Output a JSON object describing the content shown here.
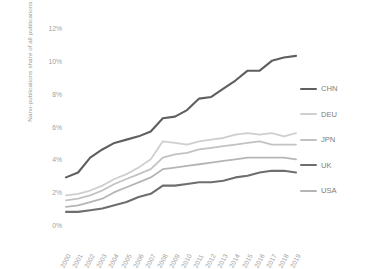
{
  "chart_data": {
    "type": "line",
    "title": "",
    "xlabel": "",
    "ylabel": "Nano-publications share of all publications of the entity",
    "x": [
      2000,
      2001,
      2002,
      2003,
      2004,
      2005,
      2006,
      2007,
      2008,
      2009,
      2010,
      2011,
      2012,
      2013,
      2014,
      2015,
      2016,
      2017,
      2018,
      2019
    ],
    "xtick_labels": [
      "2000",
      "2001",
      "2002",
      "2003",
      "2004",
      "2005",
      "2006",
      "2007",
      "2008",
      "2009",
      "2010",
      "2011",
      "2012",
      "2013",
      "2014",
      "2015",
      "2016",
      "2017",
      "2018",
      "2019"
    ],
    "ytick_labels": [
      "0%",
      "2%",
      "4%",
      "6%",
      "8%",
      "10%",
      "12%"
    ],
    "ytick_values": [
      0,
      2,
      4,
      6,
      8,
      10,
      12
    ],
    "ylim": [
      0,
      12
    ],
    "grid": false,
    "legend_position": "right",
    "series": [
      {
        "name": "CHN",
        "color": "#5f5f5f",
        "values": [
          2.9,
          3.2,
          4.1,
          4.6,
          5.0,
          5.2,
          5.4,
          5.7,
          6.5,
          6.6,
          7.0,
          7.7,
          7.8,
          8.3,
          8.8,
          9.4,
          9.4,
          10.0,
          10.2,
          10.3
        ]
      },
      {
        "name": "DEU",
        "color": "#cfcfcf",
        "values": [
          1.8,
          1.9,
          2.1,
          2.4,
          2.8,
          3.1,
          3.5,
          4.0,
          5.1,
          5.0,
          4.9,
          5.1,
          5.2,
          5.3,
          5.5,
          5.6,
          5.5,
          5.6,
          5.4,
          5.6
        ]
      },
      {
        "name": "JPN",
        "color": "#c2c2c2",
        "values": [
          1.5,
          1.6,
          1.8,
          2.1,
          2.5,
          2.8,
          3.1,
          3.4,
          4.1,
          4.3,
          4.4,
          4.6,
          4.7,
          4.8,
          4.9,
          5.0,
          5.1,
          4.9,
          4.9,
          4.9
        ]
      },
      {
        "name": "UK",
        "color": "#6e6e6e",
        "values": [
          0.8,
          0.8,
          0.9,
          1.0,
          1.2,
          1.4,
          1.7,
          1.9,
          2.4,
          2.4,
          2.5,
          2.6,
          2.6,
          2.7,
          2.9,
          3.0,
          3.2,
          3.3,
          3.3,
          3.2
        ]
      },
      {
        "name": "USA",
        "color": "#b5b5b5",
        "values": [
          1.1,
          1.2,
          1.4,
          1.6,
          2.0,
          2.3,
          2.6,
          2.9,
          3.4,
          3.5,
          3.6,
          3.7,
          3.8,
          3.9,
          4.0,
          4.1,
          4.1,
          4.1,
          4.1,
          4.0
        ]
      }
    ]
  },
  "legend": {
    "entries": [
      {
        "label": "CHN"
      },
      {
        "label": "DEU"
      },
      {
        "label": "JPN"
      },
      {
        "label": "UK"
      },
      {
        "label": "USA"
      }
    ]
  },
  "axes": {
    "y_title": "Nano-publications share of all publications of the entity"
  },
  "colors": {
    "background": "#ffffff",
    "tick_text": "#a2a2a2",
    "legend_text": "#7d7d7d"
  }
}
